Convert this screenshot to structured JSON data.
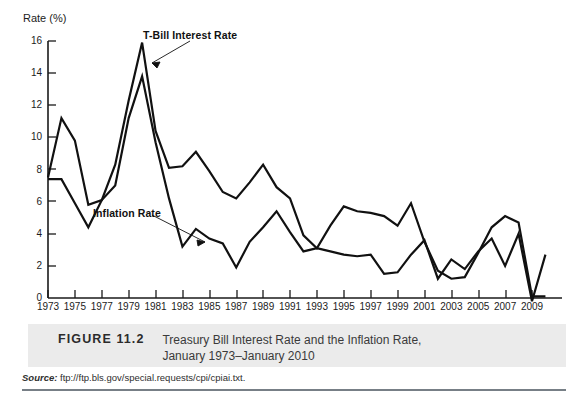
{
  "figure": {
    "number_label": "FIGURE 11.2",
    "caption_line_1": "Treasury Bill Interest Rate and the Inflation Rate,",
    "caption_line_2": "January 1973–January 2010",
    "source_label": "Source:",
    "source_value": "ftp://ftp.bls.gov/special.requests/cpi/cpiai.txt.",
    "band_color": "#ebebeb",
    "rule_color": "#777f86"
  },
  "annotations": {
    "tbill": "T-Bill Interest Rate",
    "inflation": "Inflation Rate"
  },
  "chart_data": {
    "type": "line",
    "title": "Treasury Bill Interest Rate and the Inflation Rate, January 1973–January 2010",
    "xlabel": "",
    "ylabel": "Rate (%)",
    "ylim": [
      0,
      16
    ],
    "xlim": [
      1973,
      2010
    ],
    "grid": false,
    "legend": "annotated-inline",
    "line_color": "#111111",
    "y_ticks": [
      0,
      2,
      4,
      6,
      8,
      10,
      12,
      14,
      16
    ],
    "y_tick_labels": [
      "0",
      "2",
      "4",
      "6",
      "8",
      "10",
      "12",
      "14",
      "16"
    ],
    "x_ticks": [
      1973,
      1975,
      1977,
      1979,
      1981,
      1983,
      1985,
      1987,
      1989,
      1991,
      1993,
      1995,
      1997,
      1999,
      2001,
      2003,
      2005,
      2007,
      2009
    ],
    "x_tick_labels": [
      "1973",
      "1975",
      "1977",
      "1979",
      "1981",
      "1983",
      "1985",
      "1987",
      "1989",
      "1991",
      "1993",
      "1995",
      "1997",
      "1999",
      "2001",
      "2003",
      "2005",
      "2007",
      "2009"
    ],
    "x": [
      1973,
      1974,
      1975,
      1976,
      1977,
      1978,
      1979,
      1980,
      1981,
      1982,
      1983,
      1984,
      1985,
      1986,
      1987,
      1988,
      1989,
      1990,
      1991,
      1992,
      1993,
      1994,
      1995,
      1996,
      1997,
      1998,
      1999,
      2000,
      2001,
      2002,
      2003,
      2004,
      2005,
      2006,
      2007,
      2008,
      2009,
      2010
    ],
    "series": [
      {
        "name": "T-Bill Interest Rate",
        "values": [
          7.5,
          11.2,
          9.8,
          5.8,
          6.1,
          8.3,
          12.3,
          15.9,
          10.4,
          8.1,
          8.2,
          9.1,
          7.9,
          6.6,
          6.2,
          7.2,
          8.3,
          6.9,
          6.2,
          3.9,
          3.1,
          4.5,
          5.7,
          5.4,
          5.3,
          5.1,
          4.5,
          5.9,
          3.5,
          1.7,
          1.2,
          1.3,
          2.8,
          4.4,
          5.1,
          4.7,
          0.1,
          0.1
        ]
      },
      {
        "name": "Inflation Rate",
        "values": [
          7.4,
          7.4,
          5.9,
          4.4,
          6.1,
          7.0,
          11.2,
          13.8,
          9.7,
          6.2,
          3.2,
          4.3,
          3.7,
          3.4,
          1.9,
          3.5,
          4.4,
          5.4,
          4.1,
          2.9,
          3.1,
          2.9,
          2.7,
          2.6,
          2.7,
          1.5,
          1.6,
          2.7,
          3.6,
          1.2,
          2.4,
          1.8,
          2.9,
          3.7,
          2.0,
          4.0,
          -0.2,
          2.7
        ]
      }
    ],
    "notes": {
      "tbill_peak": {
        "year": 1980,
        "value": 15.9
      },
      "inflation_peak": {
        "year": 1980,
        "value": 13.8
      },
      "tbill_trough": {
        "year": 2009,
        "value": 0.1
      },
      "inflation_trough": {
        "year": 2009,
        "value": -0.2
      }
    }
  }
}
